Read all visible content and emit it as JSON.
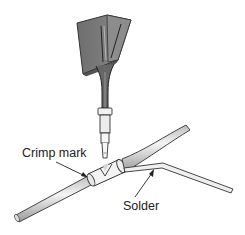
{
  "figure": {
    "labels": {
      "crimp_mark": "Crimp mark",
      "solder": "Solder"
    },
    "colors": {
      "iron_body": "#7a7a7a",
      "iron_edge": "#333333",
      "wire_fill": "#e4e4e4",
      "outline": "#333333",
      "text": "#222222"
    }
  }
}
